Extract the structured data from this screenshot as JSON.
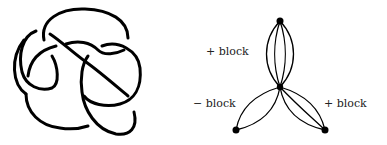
{
  "figure": {
    "left_panel": {
      "description": "knot diagram"
    },
    "right_panel": {
      "description": "graph with three blocks joined at a central vertex",
      "labels": {
        "top": "+ block",
        "left": "− block",
        "right": "+ block"
      },
      "vertices": [
        {
          "id": "top",
          "x": 280,
          "y": 21
        },
        {
          "id": "center",
          "x": 280,
          "y": 87
        },
        {
          "id": "bottom-left",
          "x": 236,
          "y": 130
        },
        {
          "id": "bottom-right",
          "x": 325,
          "y": 130
        }
      ],
      "blocks": [
        {
          "name": "top",
          "sign": "+",
          "edge_count": 4
        },
        {
          "name": "left",
          "sign": "-",
          "edge_count": 2
        },
        {
          "name": "right",
          "sign": "+",
          "edge_count": 3
        }
      ]
    },
    "colors": {
      "stroke": "#000000",
      "background": "#ffffff",
      "text": "#222222"
    }
  }
}
